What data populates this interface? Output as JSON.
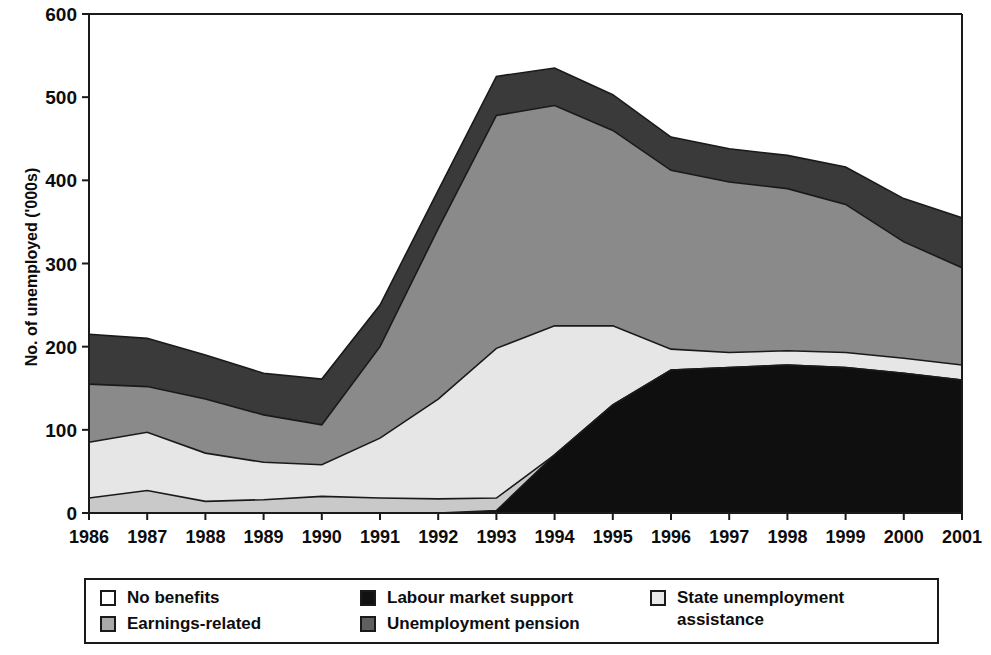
{
  "chart_data": {
    "type": "area",
    "title": "",
    "subtitle": "",
    "xlabel": "",
    "ylabel": "No. of unemployed ('000s)",
    "stacked": true,
    "grid": false,
    "legend_position": "bottom",
    "xlim": [
      1986,
      2001
    ],
    "ylim": [
      0,
      600
    ],
    "yticks": [
      0,
      100,
      200,
      300,
      400,
      500,
      600
    ],
    "categories": [
      "1986",
      "1987",
      "1988",
      "1989",
      "1990",
      "1991",
      "1992",
      "1993",
      "1994",
      "1995",
      "1996",
      "1997",
      "1998",
      "1999",
      "2000",
      "2001"
    ],
    "x": [
      1986,
      1987,
      1988,
      1989,
      1990,
      1991,
      1992,
      1993,
      1994,
      1995,
      1996,
      1997,
      1998,
      1999,
      2000,
      2001
    ],
    "series": [
      {
        "name": "Labour market support",
        "color": "#111111",
        "values": [
          0,
          0,
          0,
          0,
          0,
          0,
          0,
          3,
          70,
          130,
          172,
          175,
          178,
          175,
          168,
          160
        ]
      },
      {
        "name": "No benefits",
        "color": "#e8e8e8",
        "values": [
          0,
          0,
          0,
          0,
          0,
          0,
          0,
          0,
          0,
          0,
          0,
          0,
          0,
          0,
          0,
          0
        ]
      },
      {
        "name": "State unemployment assistance",
        "color": "#cfcfcf",
        "values": [
          18,
          27,
          14,
          16,
          20,
          18,
          17,
          15,
          0,
          0,
          0,
          0,
          0,
          0,
          0,
          0
        ]
      },
      {
        "name": "Earnings-related",
        "color": "#e8e8e8",
        "values": [
          67,
          70,
          58,
          45,
          38,
          72,
          120,
          180,
          155,
          95,
          25,
          18,
          17,
          18,
          18,
          18
        ]
      },
      {
        "name": "Unemployment pension",
        "color": "#878787",
        "values": [
          70,
          55,
          65,
          57,
          48,
          110,
          205,
          280,
          265,
          235,
          215,
          205,
          195,
          178,
          140,
          117
        ]
      },
      {
        "name": "Dark cap",
        "color": "#3a3a3a",
        "values": [
          60,
          58,
          53,
          50,
          55,
          50,
          46,
          47,
          45,
          43,
          40,
          40,
          40,
          45,
          52,
          60
        ]
      }
    ],
    "band_tops": {
      "total": [
        215,
        210,
        190,
        168,
        161,
        250,
        388,
        525,
        535,
        503,
        452,
        438,
        430,
        416,
        378,
        355
      ],
      "after_dark": [
        155,
        152,
        137,
        118,
        106,
        200,
        342,
        478,
        490,
        460,
        412,
        398,
        390,
        371,
        326,
        295
      ],
      "after_medium": [
        85,
        97,
        72,
        61,
        58,
        90,
        137,
        198,
        225,
        225,
        197,
        193,
        195,
        193,
        186,
        178
      ],
      "after_light": [
        18,
        27,
        14,
        16,
        20,
        18,
        17,
        18,
        70,
        130,
        172,
        175,
        178,
        175,
        168,
        160
      ]
    }
  },
  "axis": {
    "y_tick_labels": [
      "600",
      "500",
      "400",
      "300",
      "200",
      "100",
      "0"
    ],
    "x_tick_labels": [
      "1986",
      "1987",
      "1988",
      "1989",
      "1990",
      "1991",
      "1992",
      "1993",
      "1994",
      "1995",
      "1996",
      "1997",
      "1998",
      "1999",
      "2000",
      "2001"
    ],
    "y_axis_title": "No. of unemployed ('000s)"
  },
  "legend": {
    "items": [
      {
        "label": "No benefits",
        "swatch": "#ffffff"
      },
      {
        "label": "Earnings-related",
        "swatch": "#aaaaaa"
      },
      {
        "label": "Labour market support",
        "swatch": "#111111"
      },
      {
        "label": "Unemployment pension",
        "swatch": "#5f5f5f"
      },
      {
        "label": "State unemployment\nassistance",
        "swatch": "#e8e8e8"
      }
    ]
  }
}
